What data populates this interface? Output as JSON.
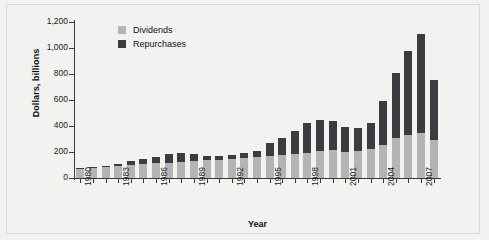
{
  "chart_data": {
    "type": "bar",
    "stacked": true,
    "title": "",
    "subtitle": "",
    "xlabel": "Year",
    "ylabel": "Dollars, billions",
    "ylim": [
      0,
      1200
    ],
    "ytick_labels": [
      "0",
      "200",
      "400",
      "600",
      "800",
      "1,000",
      "1,200"
    ],
    "ytick_values": [
      0,
      200,
      400,
      600,
      800,
      1000,
      1200
    ],
    "grid": false,
    "legend_position": "top-left",
    "categories": [
      "1980",
      "1981",
      "1982",
      "1983",
      "1984",
      "1985",
      "1986",
      "1987",
      "1988",
      "1989",
      "1990",
      "1991",
      "1992",
      "1993",
      "1994",
      "1995",
      "1996",
      "1997",
      "1998",
      "1999",
      "2000",
      "2001",
      "2002",
      "2003",
      "2004",
      "2005",
      "2006",
      "2007",
      "2008"
    ],
    "xtick_labels_shown": [
      "1980",
      "1983",
      "1986",
      "1989",
      "1992",
      "1995",
      "1998",
      "2001",
      "2004",
      "2007"
    ],
    "series": [
      {
        "name": "Dividends",
        "color": "#b4b4b4",
        "values": [
          70,
          78,
          84,
          96,
          98,
          110,
          112,
          118,
          122,
          130,
          140,
          140,
          145,
          155,
          160,
          170,
          180,
          185,
          195,
          205,
          215,
          200,
          205,
          225,
          255,
          310,
          330,
          345,
          295
        ]
      },
      {
        "name": "Repurchases",
        "color": "#3c3c40",
        "values": [
          4,
          4,
          10,
          10,
          30,
          38,
          48,
          70,
          68,
          52,
          28,
          32,
          35,
          40,
          45,
          100,
          125,
          180,
          230,
          240,
          225,
          190,
          180,
          200,
          335,
          500,
          650,
          765,
          460
        ]
      }
    ],
    "totals": [
      74,
      82,
      94,
      106,
      128,
      148,
      160,
      188,
      190,
      182,
      168,
      172,
      180,
      195,
      205,
      270,
      305,
      365,
      425,
      445,
      440,
      390,
      385,
      425,
      590,
      810,
      980,
      1110,
      755
    ]
  },
  "legend": {
    "items": [
      {
        "label": "Dividends",
        "color": "#b4b4b4"
      },
      {
        "label": "Repurchases",
        "color": "#3c3c40"
      }
    ]
  },
  "axes": {
    "y_title": "Dollars, billions",
    "x_title": "Year"
  }
}
